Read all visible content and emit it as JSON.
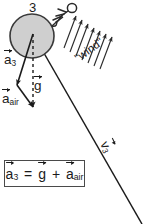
{
  "figure": {
    "background_color": "#ffffff",
    "ink_color": "#1b1b1b",
    "ball_fill_color": "#cfcfcf",
    "ball_stroke_color": "#3a3a3a"
  },
  "ball": {
    "label": "3",
    "center_x": 32,
    "center_y": 36,
    "radius": 22
  },
  "stick_figure": {
    "name": "person-icon",
    "head_x": 72,
    "head_y": 7
  },
  "wind": {
    "label": "\"wind\"",
    "arrow_count": 7,
    "direction_degrees": 54
  },
  "vectors": {
    "a3": {
      "symbol": "a",
      "subscript": "3",
      "label": "a⃗3",
      "style": "solid"
    },
    "g": {
      "symbol": "g",
      "subscript": "",
      "label": "g⃗",
      "style": "dashed"
    },
    "a_air": {
      "symbol": "a",
      "subscript": "air",
      "label": "a⃗air",
      "style": "solid"
    },
    "v3": {
      "symbol": "v",
      "subscript": "3",
      "label": "v⃗3",
      "style": "trajectory-line"
    }
  },
  "equation": {
    "lhs_symbol": "a",
    "lhs_subscript": "3",
    "equals": "=",
    "term1_symbol": "g",
    "plus": "+",
    "term2_symbol": "a",
    "term2_subscript": "air",
    "plain_text": "a3 = g + a_air"
  }
}
